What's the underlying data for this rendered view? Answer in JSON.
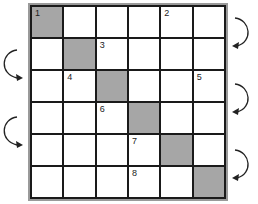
{
  "grid": {
    "rows": 6,
    "cols": 6,
    "shaded_cells": [
      [
        0,
        0
      ],
      [
        1,
        1
      ],
      [
        2,
        2
      ],
      [
        3,
        3
      ],
      [
        4,
        4
      ],
      [
        5,
        5
      ]
    ],
    "numbers": [
      {
        "label": "1",
        "row": 0,
        "col": 0
      },
      {
        "label": "2",
        "row": 0,
        "col": 4
      },
      {
        "label": "3",
        "row": 1,
        "col": 2
      },
      {
        "label": "4",
        "row": 2,
        "col": 1
      },
      {
        "label": "5",
        "row": 2,
        "col": 5
      },
      {
        "label": "6",
        "row": 3,
        "col": 2
      },
      {
        "label": "7",
        "row": 4,
        "col": 3
      },
      {
        "label": "8",
        "row": 5,
        "col": 3
      }
    ],
    "colors": {
      "shaded": "#a6a6a6",
      "line": "#1a1a1a",
      "frame": "#9a9a9a"
    }
  },
  "arrows": [
    {
      "side": "right",
      "row_from": 0,
      "row_to": 1,
      "icon": "curved-arrow-left"
    },
    {
      "side": "left",
      "row_from": 1,
      "row_to": 2,
      "icon": "curved-arrow-right"
    },
    {
      "side": "right",
      "row_from": 2,
      "row_to": 3,
      "icon": "curved-arrow-left"
    },
    {
      "side": "left",
      "row_from": 3,
      "row_to": 4,
      "icon": "curved-arrow-right"
    },
    {
      "side": "right",
      "row_from": 4,
      "row_to": 5,
      "icon": "curved-arrow-left"
    }
  ],
  "cells": {
    "r0c0": "1",
    "r0c4": "2",
    "r1c2": "3",
    "r2c1": "4",
    "r2c5": "5",
    "r3c2": "6",
    "r4c3": "7",
    "r5c3": "8"
  }
}
